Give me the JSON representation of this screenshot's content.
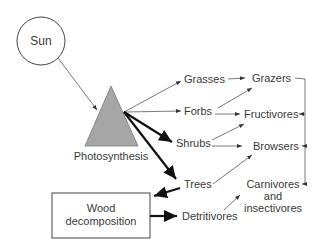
{
  "diagram": {
    "source": {
      "label": "Sun"
    },
    "producer": {
      "label": "Photosynthesis",
      "fill": "#a6a6a6"
    },
    "plants": [
      {
        "label": "Grasses"
      },
      {
        "label": "Forbs"
      },
      {
        "label": "Shrubs"
      },
      {
        "label": "Trees"
      },
      {
        "label": "Detritivores"
      }
    ],
    "consumers": [
      {
        "label": "Grazers"
      },
      {
        "label": "Fructivores"
      },
      {
        "label": "Browsers"
      },
      {
        "label": "Carnivores and insectivores",
        "lines": [
          "Carnivores",
          "and",
          "insectivores"
        ]
      }
    ],
    "decomposition": {
      "label1": "Wood",
      "label2": "decomposition"
    },
    "edges": [
      {
        "from": "Sun",
        "to": "Photosynthesis"
      },
      {
        "from": "Photosynthesis",
        "to": "Grasses"
      },
      {
        "from": "Photosynthesis",
        "to": "Forbs"
      },
      {
        "from": "Photosynthesis",
        "to": "Shrubs",
        "weight": "bold"
      },
      {
        "from": "Photosynthesis",
        "to": "Trees",
        "weight": "bold"
      },
      {
        "from": "Trees",
        "to": "Wood decomposition",
        "weight": "bold"
      },
      {
        "from": "Wood decomposition",
        "to": "Detritivores",
        "weight": "bold"
      },
      {
        "from": "Grasses",
        "to": "Grazers"
      },
      {
        "from": "Forbs",
        "to": "Grazers"
      },
      {
        "from": "Forbs",
        "to": "Fructivores"
      },
      {
        "from": "Shrubs",
        "to": "Fructivores"
      },
      {
        "from": "Shrubs",
        "to": "Browsers"
      },
      {
        "from": "Trees",
        "to": "Browsers"
      },
      {
        "from": "Detritivores",
        "to": "Carnivores and insectivores"
      },
      {
        "from": "Grazers",
        "to": "Carnivores and insectivores"
      },
      {
        "from": "Fructivores",
        "to": "Carnivores and insectivores"
      },
      {
        "from": "Browsers",
        "to": "Carnivores and insectivores"
      }
    ]
  }
}
